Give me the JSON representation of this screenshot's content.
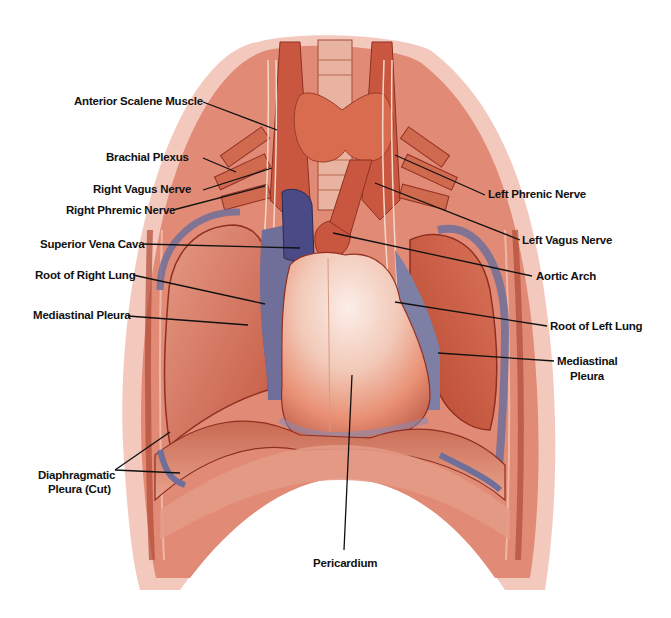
{
  "figure": {
    "colors": {
      "muscle": "#c9573f",
      "muscle_dark": "#8f2f22",
      "muscle_light": "#e68a6e",
      "body_outline": "#e7a193",
      "pleura_blue": "#6f6f9a",
      "vena_cava": "#4a4a86",
      "pericardium_light": "#f4ddd3",
      "pericardium_base": "#e88f73",
      "thyroid": "#d96c4e",
      "leader_line": "#111111"
    }
  },
  "labels": [
    {
      "id": "anterior-scalene-muscle",
      "text": "Anterior Scalene Muscle"
    },
    {
      "id": "brachial-plexus",
      "text": "Brachial Plexus"
    },
    {
      "id": "right-vagus-nerve",
      "text": "Right Vagus Nerve"
    },
    {
      "id": "right-phremic-nerve",
      "text": "Right Phremic Nerve"
    },
    {
      "id": "superior-vena-cava",
      "text": "Superior Vena Cava"
    },
    {
      "id": "root-of-right-lung",
      "text": "Root of Right Lung"
    },
    {
      "id": "mediastinal-pleura-right",
      "text": "Mediastinal Pleura"
    },
    {
      "id": "diaphragmatic-pleura-line1",
      "text": "Diaphragmatic"
    },
    {
      "id": "diaphragmatic-pleura-line2",
      "text": "Pleura (Cut)"
    },
    {
      "id": "left-phrenic-nerve",
      "text": "Left Phrenic Nerve"
    },
    {
      "id": "left-vagus-nerve",
      "text": "Left Vagus Nerve"
    },
    {
      "id": "aortic-arch",
      "text": "Aortic Arch"
    },
    {
      "id": "root-of-left-lung",
      "text": "Root of Left Lung"
    },
    {
      "id": "mediastinal-pleura-left-line1",
      "text": "Mediastinal"
    },
    {
      "id": "mediastinal-pleura-left-line2",
      "text": "Pleura"
    },
    {
      "id": "pericardium",
      "text": "Pericardium"
    }
  ]
}
